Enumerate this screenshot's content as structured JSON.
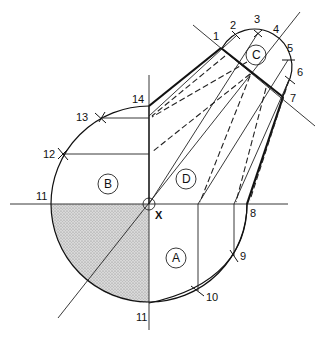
{
  "diagram": {
    "center_label": "X",
    "point_labels": [
      "1",
      "2",
      "3",
      "4",
      "5",
      "6",
      "7",
      "8",
      "9",
      "10",
      "11",
      "11",
      "12",
      "13",
      "14"
    ],
    "region_labels": [
      "A",
      "B",
      "C",
      "D"
    ],
    "shaded_region": "lower-left quadrant of circle",
    "colors": {
      "line": "#111111",
      "shading": "#c8c8c8",
      "background": "#ffffff"
    }
  }
}
